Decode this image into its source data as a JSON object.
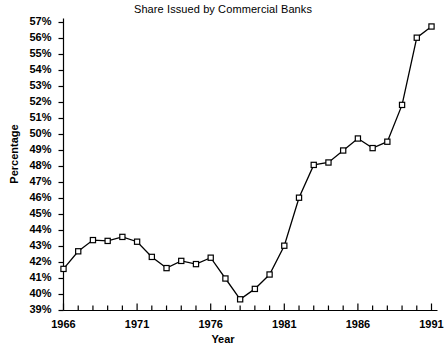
{
  "chart_data": {
    "type": "line",
    "title": "Share Issued by Commercial Banks",
    "xlabel": "Year",
    "ylabel": "Percentage",
    "grid": false,
    "legend": "none",
    "marker": "open-square",
    "xlim": [
      1966,
      1991
    ],
    "ylim": [
      39,
      57
    ],
    "ytick_labels": [
      "57%",
      "56%",
      "55%",
      "54%",
      "53%",
      "52%",
      "51%",
      "50%",
      "49%",
      "48%",
      "47%",
      "46%",
      "45%",
      "44%",
      "43%",
      "42%",
      "41%",
      "40%",
      "39%"
    ],
    "ytick_values": [
      57,
      56,
      55,
      54,
      53,
      52,
      51,
      50,
      49,
      48,
      47,
      46,
      45,
      44,
      43,
      42,
      41,
      40,
      39
    ],
    "xtick_labels": [
      "1966",
      "1971",
      "1976",
      "1981",
      "1986",
      "1991"
    ],
    "xtick_values": [
      1966,
      1971,
      1976,
      1981,
      1986,
      1991
    ],
    "x_minor_ticks_every": 1,
    "x": [
      1966,
      1967,
      1968,
      1969,
      1970,
      1971,
      1972,
      1973,
      1974,
      1975,
      1976,
      1977,
      1978,
      1979,
      1980,
      1981,
      1982,
      1983,
      1984,
      1985,
      1986,
      1987,
      1988,
      1989,
      1990,
      1991
    ],
    "values": [
      41.6,
      42.7,
      43.4,
      43.35,
      43.6,
      43.3,
      42.35,
      41.65,
      42.1,
      41.9,
      42.3,
      41.0,
      39.7,
      40.35,
      41.25,
      43.05,
      46.05,
      48.1,
      48.25,
      49.0,
      49.75,
      49.15,
      49.55,
      51.85,
      56.05,
      56.75
    ],
    "series_name": "Share Issued by Commercial Banks"
  },
  "colors": {
    "line": "#000000",
    "marker_fill": "#ffffff",
    "axis": "#000000",
    "background": "#ffffff"
  }
}
